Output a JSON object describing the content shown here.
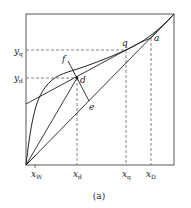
{
  "figure": {
    "caption": "(a)",
    "x_ticks": {
      "xw": {
        "base": "x",
        "sub": "W"
      },
      "xd": {
        "base": "x",
        "sub": "d"
      },
      "xq": {
        "base": "x",
        "sub": "q"
      },
      "xD": {
        "base": "x",
        "sub": "D"
      }
    },
    "y_ticks": {
      "yq": {
        "base": "y",
        "sub": "q"
      },
      "yd": {
        "base": "y",
        "sub": "d"
      }
    },
    "point_labels": {
      "q": "q",
      "a": "a",
      "f": "f",
      "d": "d",
      "e": "e"
    }
  }
}
